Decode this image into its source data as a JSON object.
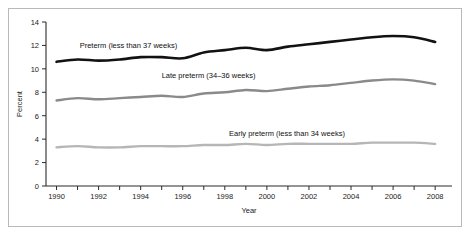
{
  "figure": {
    "background_color": "#ffffff",
    "frame_color": "#b9b9b9"
  },
  "chart_data": {
    "type": "line",
    "title": "",
    "xlabel": "Year",
    "ylabel": "Percent",
    "xlim": [
      1989.5,
      2008.8
    ],
    "ylim": [
      0,
      14
    ],
    "grid": false,
    "legend_position": "inline-labels",
    "x": [
      1990,
      1991,
      1992,
      1993,
      1994,
      1995,
      1996,
      1997,
      1998,
      1999,
      2000,
      2001,
      2002,
      2003,
      2004,
      2005,
      2006,
      2007,
      2008
    ],
    "y_ticks": [
      0,
      2,
      4,
      6,
      8,
      10,
      12,
      14
    ],
    "x_ticks": [
      1990,
      1991,
      1992,
      1993,
      1994,
      1995,
      1996,
      1997,
      1998,
      1999,
      2000,
      2001,
      2002,
      2003,
      2004,
      2005,
      2006,
      2007,
      2008
    ],
    "x_tick_labels": [
      "1990",
      "",
      "1992",
      "",
      "1994",
      "",
      "1996",
      "",
      "1998",
      "",
      "2000",
      "",
      "2002",
      "",
      "2004",
      "",
      "2006",
      "",
      "2008"
    ],
    "series": [
      {
        "name": "Preterm (less than 37 weeks)",
        "color": "#121212",
        "width": 2.6,
        "label_x": 1991.1,
        "label_y": 11.75,
        "values": [
          10.6,
          10.8,
          10.7,
          10.8,
          11.0,
          11.0,
          10.9,
          11.4,
          11.6,
          11.8,
          11.6,
          11.9,
          12.1,
          12.3,
          12.5,
          12.7,
          12.8,
          12.7,
          12.3
        ]
      },
      {
        "name": "Late preterm (34–36 weeks)",
        "color": "#8a8a8a",
        "width": 2.4,
        "label_x": 1995.0,
        "label_y": 9.2,
        "values": [
          7.3,
          7.5,
          7.4,
          7.5,
          7.6,
          7.7,
          7.6,
          7.9,
          8.0,
          8.2,
          8.1,
          8.3,
          8.5,
          8.6,
          8.8,
          9.0,
          9.1,
          9.0,
          8.7
        ]
      },
      {
        "name": "Early preterm (less than 34 weeks)",
        "color": "#b6b6b6",
        "width": 2.4,
        "label_x": 1998.2,
        "label_y": 4.25,
        "values": [
          3.3,
          3.4,
          3.3,
          3.3,
          3.4,
          3.4,
          3.4,
          3.5,
          3.5,
          3.6,
          3.5,
          3.6,
          3.6,
          3.6,
          3.6,
          3.7,
          3.7,
          3.7,
          3.6
        ]
      }
    ]
  }
}
